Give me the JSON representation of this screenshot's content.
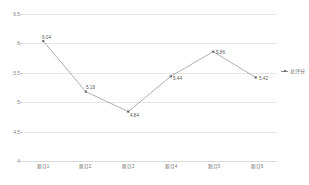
{
  "chart_data": {
    "type": "line",
    "title": "",
    "subtitle": "",
    "xlabel": "",
    "ylabel": "",
    "categories": [
      "题目1",
      "题目2",
      "题目3",
      "题目4",
      "题目5",
      "题目6"
    ],
    "series": [
      {
        "name": "总评分",
        "values": [
          6.04,
          5.18,
          4.84,
          5.44,
          5.86,
          5.42
        ],
        "point_labels": [
          "6.04",
          "5.18",
          "4.84",
          "5.44",
          "5.86",
          "5.42"
        ],
        "color": "#8f8f8f",
        "marker_color": "#6e6e6e"
      }
    ],
    "ylim": [
      4,
      6.5
    ],
    "y_ticks": [
      "6.5",
      "6",
      "5.5",
      "5",
      "4.5",
      "4"
    ],
    "y_tick_values": [
      6.5,
      6,
      5.5,
      5,
      4.5,
      4
    ],
    "grid": true,
    "grid_color": "#e6e6e6",
    "legend_position": "right",
    "legend_entries": [
      "总评分"
    ],
    "background": "#ffffff"
  }
}
